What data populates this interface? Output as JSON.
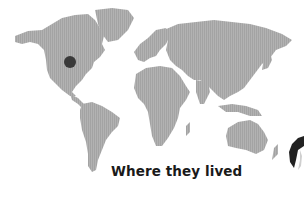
{
  "caption": "Where they lived",
  "map": {
    "land_color": "#a9a9a9",
    "marker": {
      "label": "location-marker",
      "region": "central North America",
      "color": "#3a3a3a",
      "x": 70,
      "y": 62,
      "radius": 6
    }
  },
  "edge_object": {
    "description": "partial dark curved shape cropped at right edge",
    "color": "#222222"
  }
}
